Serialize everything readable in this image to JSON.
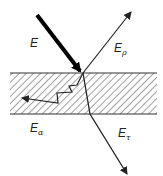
{
  "diagram": {
    "type": "energy-partition at medium",
    "medium": {
      "x": 10,
      "y": 73,
      "width": 147,
      "height": 41,
      "pattern": "diagonal-hatch"
    },
    "incident": {
      "label": "E",
      "from": [
        37,
        15
      ],
      "to": [
        80,
        71
      ],
      "stroke": "#000000",
      "width": 4
    },
    "reflected": {
      "label_main": "E",
      "label_sub": "ρ",
      "from": [
        83,
        73
      ],
      "to": [
        131,
        12
      ]
    },
    "transmitted": {
      "label_main": "E",
      "label_sub": "τ",
      "points": [
        [
          83,
          73
        ],
        [
          90,
          114
        ],
        [
          127,
          174
        ]
      ]
    },
    "absorbed": {
      "label_main": "E",
      "label_sub": "α",
      "points": [
        [
          83,
          73
        ],
        [
          77,
          85
        ],
        [
          69,
          86
        ],
        [
          72,
          92
        ],
        [
          57,
          93
        ],
        [
          58,
          103
        ],
        [
          22,
          98
        ]
      ]
    }
  },
  "labels": {
    "incident": "E",
    "reflected_main": "E",
    "reflected_sub": "ρ",
    "transmitted_main": "E",
    "transmitted_sub": "τ",
    "absorbed_main": "E",
    "absorbed_sub": "α"
  }
}
